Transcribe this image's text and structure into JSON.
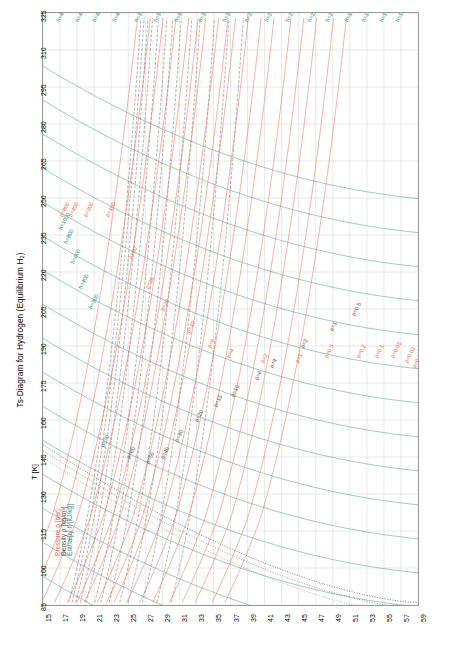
{
  "title": "Ts-Diagram for Hydrogen (Equilibrium H₂)",
  "axes": {
    "xlabel": "s [kJ/kgK]",
    "ylabel": "T [K]",
    "xticks": [
      "15",
      "17",
      "19",
      "21",
      "23",
      "25",
      "27",
      "29",
      "31",
      "33",
      "35",
      "37",
      "39",
      "41",
      "43",
      "45",
      "47",
      "49",
      "51",
      "53",
      "55",
      "57",
      "59"
    ],
    "yticks": [
      "85",
      "100",
      "115",
      "130",
      "145",
      "160",
      "175",
      "190",
      "205",
      "220",
      "235",
      "250",
      "265",
      "280",
      "295",
      "310",
      "325"
    ]
  },
  "legend": {
    "pressure": "Pressure p [bar]",
    "density": "Density ρ [kg/m³]",
    "enthalpy": "Enthalpy h [kJ/kg]"
  },
  "labels": {
    "pressure": [
      "p=800",
      "p=400",
      "p=200",
      "p=100",
      "p=50",
      "p=30",
      "p=20",
      "p=10",
      "p=6",
      "p=4",
      "p=2",
      "p=1",
      "p=0.5",
      "p=0.2",
      "p=0.1",
      "p=0.05",
      "p=0.02",
      "p=0.01"
    ],
    "density": [
      "ρ=70",
      "ρ=60",
      "ρ=50",
      "ρ=40",
      "ρ=30",
      "ρ=20",
      "ρ=15",
      "ρ=10",
      "ρ=6",
      "ρ=4",
      "ρ=2",
      "ρ=1",
      "ρ=0.5"
    ],
    "enthalpy": [
      "h=4400",
      "h=4200",
      "h=4000",
      "h=3800",
      "h=3600",
      "h=3400",
      "h=3200",
      "h=3000",
      "h=2800",
      "h=2600",
      "h=2400",
      "h=2200",
      "h=2000",
      "h=1800",
      "h=1600",
      "h=1400",
      "h=1200",
      "h=1000",
      "h=800",
      "h=600",
      "h=400",
      "h=300"
    ]
  },
  "colors": {
    "pressure": "#e8684a",
    "density": "#555555",
    "enthalpy": "#2e8b78",
    "grid": "#cfcfcf",
    "frame": "#9a9a9a",
    "saturation": "#333333"
  },
  "chart_data": {
    "type": "line",
    "title": "Ts-Diagram for Hydrogen (Equilibrium H₂)",
    "xlabel": "s [kJ/kgK]",
    "ylabel": "T [K]",
    "xlim": [
      15,
      59
    ],
    "ylim": [
      85,
      325
    ],
    "grid": true,
    "legend_position": "lower-left-vertical",
    "series": [
      {
        "name": "Isobars p [bar]",
        "color": "#e8684a",
        "values": [
          800,
          400,
          200,
          100,
          50,
          30,
          20,
          10,
          6,
          4,
          2,
          1,
          0.5,
          0.2,
          0.1,
          0.05,
          0.02,
          0.01
        ]
      },
      {
        "name": "Isochores ρ [kg/m³]",
        "color": "#555555",
        "values": [
          70,
          60,
          50,
          40,
          30,
          20,
          15,
          10,
          6,
          4,
          2,
          1,
          0.5
        ]
      },
      {
        "name": "Isenthalps h [kJ/kg]",
        "color": "#2e8b78",
        "values": [
          4400,
          4200,
          4000,
          3800,
          3600,
          3400,
          3200,
          3000,
          2800,
          2600,
          2400,
          2200,
          2000,
          1800,
          1600,
          1400,
          1200,
          1000,
          800,
          600,
          400,
          300
        ]
      },
      {
        "name": "Saturation / two-phase dome",
        "color": "#333333",
        "values": []
      }
    ]
  }
}
